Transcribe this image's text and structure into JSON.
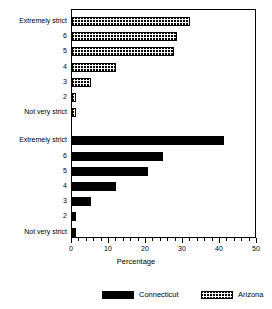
{
  "chart_data": {
    "type": "bar",
    "orientation": "horizontal",
    "title": "",
    "xlabel": "Percentage",
    "ylabel": "",
    "xlim": [
      0,
      50
    ],
    "xticks": [
      0,
      10,
      20,
      30,
      40,
      50
    ],
    "xtick_labels": [
      "0",
      "10",
      "20",
      "30",
      "40",
      "50"
    ],
    "minor_tick_step": 2,
    "grid": false,
    "legend_position": "bottom",
    "categories": [
      "Extremely strict",
      "6",
      "5",
      "4",
      "3",
      "2",
      "Not very strict"
    ],
    "series": [
      {
        "name": "Arizona",
        "fill": "hatched",
        "color": "#000000",
        "group_order": 1,
        "values": [
          32,
          28.5,
          27.5,
          12,
          5,
          1,
          1
        ]
      },
      {
        "name": "Connecticut",
        "fill": "solid",
        "color": "#000000",
        "group_order": 2,
        "values": [
          41,
          24.5,
          20.5,
          12,
          5,
          1,
          1
        ]
      }
    ]
  },
  "axis": {
    "x_title": "Percentage",
    "tick_labels": [
      "0",
      "10",
      "20",
      "30",
      "40",
      "50"
    ]
  },
  "groups": [
    {
      "series_name": "Arizona",
      "fill": "hatched",
      "rows": [
        {
          "label": "Extremely strict",
          "value": 32
        },
        {
          "label": "6",
          "value": 28.5
        },
        {
          "label": "5",
          "value": 27.5
        },
        {
          "label": "4",
          "value": 12
        },
        {
          "label": "3",
          "value": 5
        },
        {
          "label": "2",
          "value": 1
        },
        {
          "label": "Not very strict",
          "value": 1
        }
      ]
    },
    {
      "series_name": "Connecticut",
      "fill": "solid",
      "rows": [
        {
          "label": "Extremely strict",
          "value": 41
        },
        {
          "label": "6",
          "value": 24.5
        },
        {
          "label": "5",
          "value": 20.5
        },
        {
          "label": "4",
          "value": 12
        },
        {
          "label": "3",
          "value": 5
        },
        {
          "label": "2",
          "value": 1
        },
        {
          "label": "Not very strict",
          "value": 1
        }
      ]
    }
  ],
  "legend": {
    "items": [
      {
        "label": "Connecticut",
        "fill": "solid"
      },
      {
        "label": "Arizona",
        "fill": "hatched"
      }
    ]
  }
}
